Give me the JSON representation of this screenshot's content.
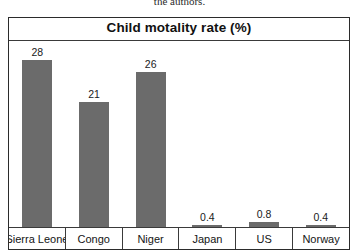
{
  "caption_fragment": "the authors.",
  "chart_data": {
    "type": "bar",
    "title": "Child motality rate (%)",
    "xlabel": "",
    "ylabel": "",
    "ylim": [
      0,
      30
    ],
    "grid": false,
    "legend": "none",
    "orientation": "vertical",
    "bar_color": "#6b6b6b",
    "categories": [
      "Sierra Leone",
      "Congo",
      "Niger",
      "Japan",
      "US",
      "Norway"
    ],
    "values": [
      28,
      21,
      26,
      0.4,
      0.8,
      0.4
    ],
    "value_labels": [
      "28",
      "21",
      "26",
      "0.4",
      "0.8",
      "0.4"
    ]
  }
}
